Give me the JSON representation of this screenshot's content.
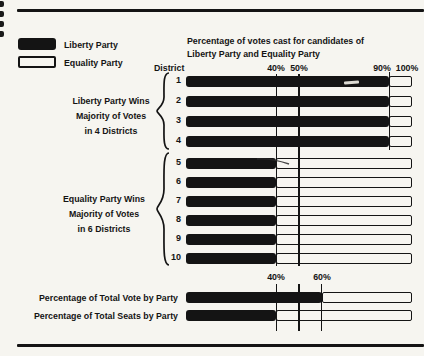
{
  "page": {
    "background": "#f6f5f0",
    "ink": "#141414"
  },
  "legend": {
    "items": [
      {
        "label": "Liberty Party",
        "swatch": "filled"
      },
      {
        "label": "Equality Party",
        "swatch": "outline"
      }
    ]
  },
  "title": {
    "line1": "Percentage of votes cast for candidates of",
    "line2": "Liberty Party and Equality Party"
  },
  "axis": {
    "district_label": "District",
    "top_ticks": [
      {
        "label": "40%",
        "pct": 40
      },
      {
        "label": "50%",
        "pct": 50
      },
      {
        "label": "90%",
        "pct": 90
      },
      {
        "label": "100%",
        "pct": 100
      }
    ],
    "bottom_ticks": [
      {
        "label": "40%",
        "pct": 40
      },
      {
        "label": "60%",
        "pct": 60
      }
    ],
    "bottom_unlabeled_tick_pct": 50
  },
  "groups": [
    {
      "lines": [
        "Liberty Party Wins",
        "Majority of Votes",
        "in 4 Districts"
      ]
    },
    {
      "lines": [
        "Equality Party Wins",
        "Majority of Votes",
        "in 6 Districts"
      ]
    }
  ],
  "districts": [
    {
      "id": "1",
      "liberty": 90,
      "equality": 10
    },
    {
      "id": "2",
      "liberty": 90,
      "equality": 10
    },
    {
      "id": "3",
      "liberty": 90,
      "equality": 10
    },
    {
      "id": "4",
      "liberty": 90,
      "equality": 10
    },
    {
      "id": "5",
      "liberty": 40,
      "equality": 60
    },
    {
      "id": "6",
      "liberty": 40,
      "equality": 60
    },
    {
      "id": "7",
      "liberty": 40,
      "equality": 60
    },
    {
      "id": "8",
      "liberty": 40,
      "equality": 60
    },
    {
      "id": "9",
      "liberty": 40,
      "equality": 60
    },
    {
      "id": "10",
      "liberty": 40,
      "equality": 60
    }
  ],
  "totals": [
    {
      "label": "Percentage of Total Vote by Party",
      "liberty": 60,
      "equality": 40
    },
    {
      "label": "Percentage of Total Seats by Party",
      "liberty": 40,
      "equality": 60
    }
  ],
  "chart_data": {
    "type": "bar",
    "orientation": "horizontal",
    "stacked": true,
    "title": "Percentage of votes cast for candidates of Liberty Party and Equality Party",
    "xlabel": "Percent of votes",
    "ylabel": "District",
    "x_range": [
      0,
      100
    ],
    "top_axis_tick_labels": [
      "40%",
      "50%",
      "90%",
      "100%"
    ],
    "bottom_axis_tick_labels": [
      "40%",
      "60%"
    ],
    "categories": [
      "1",
      "2",
      "3",
      "4",
      "5",
      "6",
      "7",
      "8",
      "9",
      "10",
      "Percentage of Total Vote by Party",
      "Percentage of Total Seats by Party"
    ],
    "series": [
      {
        "name": "Liberty Party",
        "values": [
          90,
          90,
          90,
          90,
          40,
          40,
          40,
          40,
          40,
          40,
          60,
          40
        ]
      },
      {
        "name": "Equality Party",
        "values": [
          10,
          10,
          10,
          10,
          60,
          60,
          60,
          60,
          60,
          60,
          40,
          60
        ]
      }
    ],
    "annotations": [
      "Liberty Party Wins Majority of Votes in 4 Districts",
      "Equality Party Wins Majority of Votes in 6 Districts"
    ],
    "legend_position": "top-left",
    "grid": "vertical reference lines at 40%, 50%, 90% (districts) and 40%, 50%, 60% (totals)"
  }
}
